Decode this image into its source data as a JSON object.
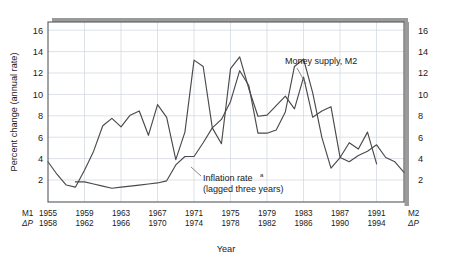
{
  "chart_data": {
    "type": "line",
    "title": "",
    "xlabel": "Year",
    "ylabel": "Percent change (annual rate)",
    "ylim": [
      0,
      17
    ],
    "xlim": [
      1955,
      1994
    ],
    "grid": true,
    "legend": "annotations",
    "y_ticks": [
      2,
      4,
      6,
      8,
      10,
      12,
      14,
      16
    ],
    "y_ticks_right": [
      2,
      4,
      6,
      8,
      10,
      12,
      14,
      16
    ],
    "x_ticks_m1": [
      1955,
      1959,
      1963,
      1967,
      1971,
      1975,
      1979,
      1983,
      1987,
      1991
    ],
    "x_ticks_dp": [
      1958,
      1962,
      1966,
      1970,
      1974,
      1978,
      1982,
      1986,
      1990,
      1994
    ],
    "x_corner_left_top": "M1",
    "x_corner_left_bottom": "ΔP",
    "x_corner_right_top": "M2",
    "x_corner_right_bottom": "ΔP",
    "annotations": [
      {
        "id": "money-supply",
        "text": "Money supply, M2",
        "x": 1980.0,
        "y": 14.6
      },
      {
        "id": "inflation-rate",
        "text_line1": "Inflation rate",
        "superscript": "a",
        "text_line2": "(lagged three years)",
        "x": 1973.2,
        "y": 3.1
      }
    ],
    "series": [
      {
        "name": "Money supply, M2",
        "color": "#4a4a4a",
        "x": [
          1955,
          1956,
          1957,
          1958,
          1959,
          1960,
          1961,
          1962,
          1963,
          1964,
          1965,
          1966,
          1967,
          1968,
          1969,
          1970,
          1971,
          1972,
          1973,
          1974,
          1975,
          1976,
          1977,
          1978,
          1979,
          1980,
          1981,
          1982,
          1983,
          1984,
          1985,
          1986,
          1987,
          1988,
          1989,
          1990,
          1991
        ],
        "values": [
          3.8,
          2.6,
          1.6,
          1.4,
          3.0,
          4.8,
          7.2,
          7.9,
          7.1,
          8.2,
          8.6,
          6.3,
          9.2,
          8.0,
          4.0,
          6.6,
          13.4,
          12.8,
          7.0,
          5.5,
          12.6,
          13.7,
          10.7,
          8.1,
          8.2,
          9.1,
          10.0,
          8.8,
          11.8,
          8.0,
          8.6,
          9.0,
          4.2,
          5.6,
          5.0,
          6.6,
          3.6
        ]
      },
      {
        "name": "Inflation rate (lagged three years)",
        "color": "#4a4a4a",
        "x": [
          1958,
          1959,
          1960,
          1961,
          1962,
          1963,
          1964,
          1965,
          1966,
          1967,
          1968,
          1969,
          1970,
          1971,
          1972,
          1973,
          1974,
          1975,
          1976,
          1977,
          1978,
          1979,
          1980,
          1981,
          1982,
          1983,
          1984,
          1985,
          1986,
          1987,
          1988,
          1989,
          1990,
          1991,
          1992,
          1993,
          1994
        ],
        "values": [
          1.9,
          1.9,
          1.7,
          1.5,
          1.3,
          1.4,
          1.5,
          1.6,
          1.7,
          1.8,
          2.0,
          3.5,
          4.3,
          4.3,
          5.6,
          7.0,
          7.8,
          9.5,
          12.4,
          11.0,
          6.5,
          6.5,
          6.8,
          8.5,
          12.8,
          13.5,
          10.3,
          6.1,
          3.2,
          4.2,
          3.8,
          4.4,
          4.8,
          5.4,
          4.2,
          3.8,
          2.8
        ]
      }
    ]
  }
}
